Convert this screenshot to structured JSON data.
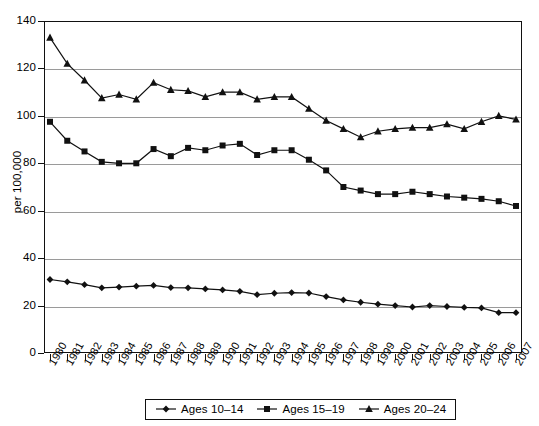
{
  "chart_data": {
    "type": "line",
    "title": "",
    "xlabel": "",
    "ylabel": "per 100,000",
    "xlim": [
      1980,
      2007
    ],
    "ylim": [
      0,
      140
    ],
    "ytick_step": 20,
    "yticks": [
      0,
      20,
      40,
      60,
      80,
      100,
      120,
      140
    ],
    "grid": "horizontal",
    "legend_position": "bottom",
    "marker_color": "#111111",
    "line_color": "#111111",
    "categories": [
      "1980",
      "1981",
      "1982",
      "1983",
      "1984",
      "1985",
      "1986",
      "1987",
      "1988",
      "1989",
      "1990",
      "1991",
      "1992",
      "1993",
      "1994",
      "1995",
      "1996",
      "1997",
      "1998",
      "1999",
      "2000",
      "2001",
      "2002",
      "2003",
      "2004",
      "2005",
      "2006",
      "2007"
    ],
    "series": [
      {
        "name": "Ages 10-14",
        "marker": "diamond",
        "values": [
          31.0,
          30.0,
          28.8,
          27.5,
          27.8,
          28.2,
          28.5,
          27.6,
          27.5,
          27.0,
          26.6,
          26.0,
          24.6,
          25.2,
          25.5,
          25.3,
          23.8,
          22.4,
          21.4,
          20.6,
          20.0,
          19.4,
          20.0,
          19.6,
          19.2,
          19.0,
          17.0,
          17.0
        ]
      },
      {
        "name": "Ages 15-19",
        "marker": "square",
        "values": [
          97.5,
          89.5,
          85.0,
          80.6,
          80.0,
          80.0,
          86.0,
          83.0,
          86.5,
          85.5,
          87.5,
          88.2,
          83.5,
          85.5,
          85.5,
          81.5,
          77.0,
          70.0,
          68.5,
          67.0,
          67.0,
          68.0,
          67.0,
          66.0,
          65.5,
          65.0,
          64.0,
          62.0
        ]
      },
      {
        "name": "Ages 20-24",
        "marker": "triangle",
        "values": [
          133.0,
          122.0,
          115.0,
          107.5,
          109.0,
          107.0,
          114.0,
          111.0,
          110.5,
          108.0,
          110.0,
          110.0,
          107.0,
          108.0,
          108.0,
          103.0,
          98.0,
          94.5,
          91.0,
          93.5,
          94.5,
          95.0,
          95.0,
          96.5,
          94.5,
          97.5,
          100.0,
          98.5
        ]
      }
    ]
  }
}
